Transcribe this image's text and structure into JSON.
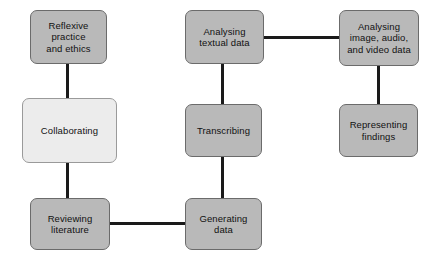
{
  "diagram": {
    "background_color": "#ffffff",
    "node_fill_color": "#b9b9b9",
    "node_highlight_fill_color": "#ececec",
    "node_border_color": "#6b6b6b",
    "connector_color": "#1a1a1a",
    "nodes": [
      {
        "id": "reflexive-practice-and-ethics",
        "label": "Reflexive\npractice\nand ethics",
        "x": 30,
        "y": 10,
        "width": 77,
        "height": 54,
        "style": "filled"
      },
      {
        "id": "collaborating",
        "label": "Collaborating",
        "x": 22,
        "y": 98,
        "width": 95,
        "height": 65,
        "style": "light"
      },
      {
        "id": "reviewing-literature",
        "label": "Reviewing\nliterature",
        "x": 30,
        "y": 198,
        "width": 80,
        "height": 52,
        "style": "filled"
      },
      {
        "id": "analysing-textual-data",
        "label": "Analysing\ntextual data",
        "x": 185,
        "y": 10,
        "width": 79,
        "height": 54,
        "style": "filled"
      },
      {
        "id": "transcribing",
        "label": "Transcribing",
        "x": 185,
        "y": 104,
        "width": 77,
        "height": 53,
        "style": "filled"
      },
      {
        "id": "generating-data",
        "label": "Generating\ndata",
        "x": 185,
        "y": 198,
        "width": 77,
        "height": 52,
        "style": "filled"
      },
      {
        "id": "analysing-image-audio-and-video-data",
        "label": "Analysing\nimage, audio,\nand video data",
        "x": 339,
        "y": 10,
        "width": 80,
        "height": 56,
        "style": "filled"
      },
      {
        "id": "representing-findings",
        "label": "Representing\nfindings",
        "x": 339,
        "y": 104,
        "width": 79,
        "height": 53,
        "style": "filled"
      }
    ],
    "connectors": [
      {
        "id": "reflexive-to-collaborating",
        "orientation": "vertical",
        "x": 67,
        "y": 63,
        "length": 37,
        "thickness": 3
      },
      {
        "id": "collaborating-to-reviewing-literature",
        "orientation": "vertical",
        "x": 67,
        "y": 161,
        "length": 39,
        "thickness": 3
      },
      {
        "id": "reviewing-literature-to-generating-data",
        "orientation": "horizontal",
        "x": 108,
        "y": 223,
        "length": 79,
        "thickness": 3
      },
      {
        "id": "generating-data-to-transcribing",
        "orientation": "vertical",
        "x": 222,
        "y": 155,
        "length": 45,
        "thickness": 3
      },
      {
        "id": "transcribing-to-analysing-textual-data",
        "orientation": "vertical",
        "x": 222,
        "y": 62,
        "length": 44,
        "thickness": 3
      },
      {
        "id": "analysing-textual-data-to-analysing-image-audio",
        "orientation": "horizontal",
        "x": 262,
        "y": 37,
        "length": 79,
        "thickness": 3
      },
      {
        "id": "analysing-image-audio-to-representing-findings",
        "orientation": "vertical",
        "x": 378,
        "y": 64,
        "length": 42,
        "thickness": 3
      }
    ]
  }
}
